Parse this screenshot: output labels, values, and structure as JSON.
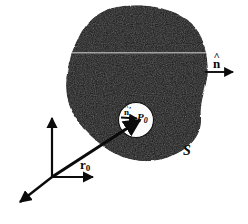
{
  "figure": {
    "background_color": "#ffffff",
    "ink_color": "#0b0b0b",
    "region_fill": "#1c1c1c",
    "cavity_fill": "#ffffff",
    "labels": {
      "outward_normal": {
        "name": "n-hat",
        "base": "n",
        "accent": "^",
        "text": "n̂"
      },
      "inner_normal": {
        "name": "n-hat-prime",
        "base": "n",
        "accent": "^",
        "prime": "′",
        "text": "n̂′"
      },
      "point": {
        "name": "P-zero",
        "base": "P",
        "subscript": "0",
        "text": "P₀"
      },
      "surface": {
        "name": "S",
        "text": "S"
      },
      "position_vector": {
        "name": "r-zero",
        "base": "r",
        "subscript": "0",
        "text": "r₀"
      }
    },
    "arrows": {
      "outward_normal_arrow": "arrow-right",
      "inner_normal_arrow": "arrow-right-small",
      "position_vector_arrow": "arrow-up-right",
      "axis_vertical": "arrow-up",
      "axis_horizontal": "arrow-right",
      "axis_oblique": "arrow-down-left"
    },
    "axes": {
      "origin_label": "",
      "count": 3
    }
  }
}
